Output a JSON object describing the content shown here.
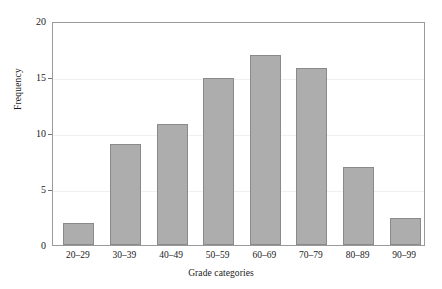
{
  "chart_data": {
    "type": "bar",
    "title": "",
    "xlabel": "Grade categories",
    "ylabel": "Frequency",
    "categories": [
      "20–29",
      "30–39",
      "40–49",
      "50–59",
      "60–69",
      "70–79",
      "80–89",
      "90–99"
    ],
    "values": [
      2.0,
      9.0,
      10.8,
      14.9,
      17.0,
      15.8,
      7.0,
      2.4
    ],
    "ylim": [
      0,
      20
    ],
    "yticks": [
      0,
      5,
      10,
      15,
      20
    ],
    "ytick_labels": [
      "0",
      "5",
      "10",
      "15",
      "20"
    ],
    "grid": true,
    "legend": null,
    "bar_color": "#adadad",
    "bar_edge_color": "#8a8a8a",
    "frame_color": "#9a9a9a",
    "background_color": "#ffffff"
  }
}
